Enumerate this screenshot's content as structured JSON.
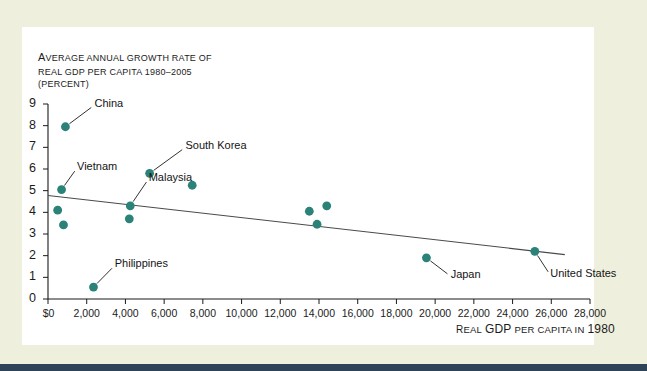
{
  "figure": {
    "title_lines": [
      "Average annual growth rate of",
      "Real GDP per capita 1980–2005",
      "(percent)"
    ],
    "x_axis_caption": "Real GDP per capita in 1980",
    "marker_color": "#2b8279",
    "panel_color": "#ffffff",
    "page_color": "#efefdd",
    "rule_color": "#2e4258"
  },
  "chart_data": {
    "type": "scatter",
    "title": "Average annual growth rate of Real GDP per capita 1980–2005 (percent)",
    "xlabel": "Real GDP per capita in 1980",
    "ylabel": "Average annual growth rate of real GDP per capita 1980-2005 (percent)",
    "xlim": [
      0,
      28000
    ],
    "ylim": [
      0,
      9
    ],
    "grid": false,
    "legend": "none",
    "xticks": [
      0,
      2000,
      4000,
      6000,
      8000,
      10000,
      12000,
      14000,
      16000,
      18000,
      20000,
      22000,
      24000,
      26000,
      28000
    ],
    "xticklabels": [
      "$0",
      "2,000",
      "4,000",
      "6,000",
      "8,000",
      "10,000",
      "12,000",
      "14,000",
      "16,000",
      "18,000",
      "20,000",
      "22,000",
      "24,000",
      "26,000",
      "28,000"
    ],
    "yticks": [
      0,
      1,
      2,
      3,
      4,
      5,
      6,
      7,
      8,
      9
    ],
    "yticklabels": [
      "0",
      "1",
      "2",
      "3",
      "4",
      "5",
      "6",
      "7",
      "8",
      "9"
    ],
    "points": [
      {
        "label": "China",
        "x": 900,
        "y": 7.95,
        "labeled": true,
        "label_x": 2400,
        "label_y": 8.95
      },
      {
        "label": "Vietnam",
        "x": 700,
        "y": 5.05,
        "labeled": true,
        "label_x": 1500,
        "label_y": 6.05
      },
      {
        "label": "",
        "x": 500,
        "y": 4.1,
        "labeled": false
      },
      {
        "label": "",
        "x": 800,
        "y": 3.42,
        "labeled": false
      },
      {
        "label": "Malaysia",
        "x": 4250,
        "y": 4.3,
        "labeled": true,
        "label_x": 5200,
        "label_y": 5.55
      },
      {
        "label": "Philippines",
        "x": 2350,
        "y": 0.55,
        "labeled": true,
        "label_x": 3450,
        "label_y": 1.55
      },
      {
        "label": "",
        "x": 4200,
        "y": 3.7,
        "labeled": false
      },
      {
        "label": "South Korea",
        "x": 5250,
        "y": 5.8,
        "labeled": true,
        "label_x": 7100,
        "label_y": 7.0
      },
      {
        "label": "",
        "x": 7450,
        "y": 5.25,
        "labeled": false
      },
      {
        "label": "",
        "x": 13500,
        "y": 4.05,
        "labeled": false
      },
      {
        "label": "",
        "x": 14400,
        "y": 4.3,
        "labeled": false
      },
      {
        "label": "",
        "x": 13900,
        "y": 3.45,
        "labeled": false
      },
      {
        "label": "Japan",
        "x": 19550,
        "y": 1.9,
        "labeled": true,
        "label_x": 20800,
        "label_y": 1.05
      },
      {
        "label": "United States",
        "x": 25150,
        "y": 2.2,
        "labeled": true,
        "label_x": 25950,
        "label_y": 1.1
      }
    ],
    "trendline": {
      "x0": 0,
      "y0": 4.78,
      "x1": 26700,
      "y1": 2.05
    }
  }
}
